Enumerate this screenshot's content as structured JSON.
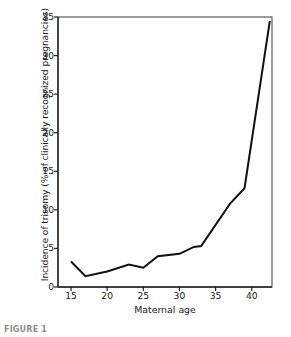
{
  "figure": {
    "caption": "FIGURE 1",
    "background_color": "#ffffff",
    "line_color": "#111111",
    "axis_color": "#3a3a3a"
  },
  "chart_data": {
    "type": "line",
    "title": "",
    "subtitle": "",
    "xlabel": "Maternal age",
    "ylabel": "Incidence of trisomy (% of clinically recognized pregnancies)",
    "xlim": [
      13.2,
      42.8
    ],
    "ylim": [
      0,
      35
    ],
    "xticks": [
      15,
      20,
      25,
      30,
      35,
      40
    ],
    "xtick_labels": [
      "15",
      "20",
      "25",
      "30",
      "35",
      "40"
    ],
    "yticks": [
      0,
      5,
      10,
      15,
      20,
      25,
      30,
      35
    ],
    "ytick_labels": [
      "0",
      "5",
      "10",
      "15",
      "20",
      "25",
      "30",
      "35"
    ],
    "grid": false,
    "legend": "none",
    "series": [
      {
        "name": "Incidence of trisomy",
        "color": "#111111",
        "x": [
          15,
          17,
          20,
          23,
          25,
          27,
          30,
          32,
          33,
          37,
          39,
          42.5
        ],
        "values": [
          3.3,
          1.4,
          2.0,
          2.9,
          2.5,
          4.0,
          4.3,
          5.2,
          5.3,
          10.8,
          12.8,
          34.5
        ]
      }
    ]
  }
}
